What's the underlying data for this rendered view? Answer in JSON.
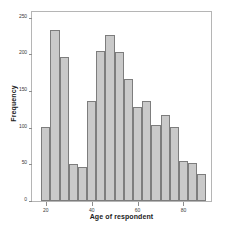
{
  "chart_data": {
    "type": "bar",
    "title": "",
    "subtitle": "",
    "xlabel": "Age of respondent",
    "ylabel": "Frequency",
    "xlim": [
      14,
      92
    ],
    "ylim": [
      0,
      258
    ],
    "grid": false,
    "legend": null,
    "bar_color": "#c9c9c9",
    "bar_edge_color": "#7d7d7d",
    "axis_color": "#b5b5b5",
    "bin_width": 4,
    "x_ticks": [
      {
        "value": 20,
        "label": "20"
      },
      {
        "value": 40,
        "label": "40"
      },
      {
        "value": 60,
        "label": "60"
      },
      {
        "value": 80,
        "label": "80"
      }
    ],
    "y_ticks": [
      {
        "value": 0,
        "label": "0"
      },
      {
        "value": 50,
        "label": "50"
      },
      {
        "value": 100,
        "label": "100"
      },
      {
        "value": 150,
        "label": "150"
      },
      {
        "value": 200,
        "label": "200"
      },
      {
        "value": 250,
        "label": "250"
      }
    ],
    "bins": [
      {
        "x_start": 18,
        "x_end": 22,
        "center": 20,
        "value": 101
      },
      {
        "x_start": 22,
        "x_end": 26,
        "center": 24,
        "value": 233
      },
      {
        "x_start": 26,
        "x_end": 30,
        "center": 28,
        "value": 197
      },
      {
        "x_start": 30,
        "x_end": 34,
        "center": 32,
        "value": 50
      },
      {
        "x_start": 34,
        "x_end": 38,
        "center": 36,
        "value": 47
      },
      {
        "x_start": 38,
        "x_end": 42,
        "center": 40,
        "value": 136
      },
      {
        "x_start": 42,
        "x_end": 46,
        "center": 44,
        "value": 205
      },
      {
        "x_start": 46,
        "x_end": 50,
        "center": 48,
        "value": 227
      },
      {
        "x_start": 50,
        "x_end": 54,
        "center": 52,
        "value": 203
      },
      {
        "x_start": 54,
        "x_end": 58,
        "center": 56,
        "value": 167
      },
      {
        "x_start": 58,
        "x_end": 62,
        "center": 60,
        "value": 129
      },
      {
        "x_start": 62,
        "x_end": 66,
        "center": 64,
        "value": 136
      },
      {
        "x_start": 66,
        "x_end": 70,
        "center": 68,
        "value": 104
      },
      {
        "x_start": 70,
        "x_end": 74,
        "center": 72,
        "value": 117
      },
      {
        "x_start": 74,
        "x_end": 78,
        "center": 76,
        "value": 101
      },
      {
        "x_start": 78,
        "x_end": 82,
        "center": 80,
        "value": 54
      },
      {
        "x_start": 82,
        "x_end": 86,
        "center": 84,
        "value": 52
      },
      {
        "x_start": 86,
        "x_end": 90,
        "center": 88,
        "value": 37
      }
    ],
    "categories": [
      "20",
      "24",
      "28",
      "32",
      "36",
      "40",
      "44",
      "48",
      "52",
      "56",
      "60",
      "64",
      "68",
      "72",
      "76",
      "80",
      "84",
      "88"
    ],
    "values": [
      101,
      233,
      197,
      50,
      47,
      136,
      205,
      227,
      203,
      167,
      129,
      136,
      104,
      117,
      101,
      54,
      52,
      37
    ]
  }
}
